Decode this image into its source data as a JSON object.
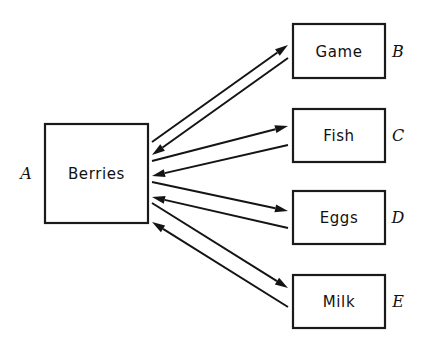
{
  "diagram": {
    "type": "flow-exchange-diagram",
    "background_color": "#ffffff",
    "line_color": "#141414",
    "text_color": "#111111",
    "hub": {
      "key": "A",
      "label": "Berries",
      "box": {
        "x": 45,
        "y": 124,
        "width": 103,
        "height": 99
      },
      "key_position": {
        "x": 26,
        "y": 174
      }
    },
    "nodes": [
      {
        "key": "B",
        "label": "Game",
        "box": {
          "x": 293,
          "y": 24,
          "width": 92,
          "height": 54
        },
        "key_position": {
          "x": 398,
          "y": 52
        }
      },
      {
        "key": "C",
        "label": "Fish",
        "box": {
          "x": 293,
          "y": 109,
          "width": 92,
          "height": 53
        },
        "key_position": {
          "x": 398,
          "y": 136
        }
      },
      {
        "key": "D",
        "label": "Eggs",
        "box": {
          "x": 293,
          "y": 191,
          "width": 92,
          "height": 53
        },
        "key_position": {
          "x": 398,
          "y": 218
        }
      },
      {
        "key": "E",
        "label": "Milk",
        "box": {
          "x": 293,
          "y": 275,
          "width": 92,
          "height": 53
        },
        "key_position": {
          "x": 398,
          "y": 302
        }
      }
    ],
    "connections": [
      {
        "name": "berries-to-game",
        "from": "A",
        "to": "B",
        "direction": "outbound",
        "start": {
          "x": 152,
          "y": 142
        },
        "end": {
          "x": 288,
          "y": 45
        }
      },
      {
        "name": "game-to-berries",
        "from": "B",
        "to": "A",
        "direction": "inbound",
        "start": {
          "x": 288,
          "y": 58
        },
        "end": {
          "x": 152,
          "y": 155
        }
      },
      {
        "name": "berries-to-fish",
        "from": "A",
        "to": "C",
        "direction": "outbound",
        "start": {
          "x": 152,
          "y": 161
        },
        "end": {
          "x": 288,
          "y": 126
        }
      },
      {
        "name": "fish-to-berries",
        "from": "C",
        "to": "A",
        "direction": "inbound",
        "start": {
          "x": 288,
          "y": 145
        },
        "end": {
          "x": 152,
          "y": 176
        }
      },
      {
        "name": "berries-to-eggs",
        "from": "A",
        "to": "D",
        "direction": "outbound",
        "start": {
          "x": 152,
          "y": 182
        },
        "end": {
          "x": 288,
          "y": 211
        }
      },
      {
        "name": "eggs-to-berries",
        "from": "D",
        "to": "A",
        "direction": "inbound",
        "start": {
          "x": 288,
          "y": 228
        },
        "end": {
          "x": 152,
          "y": 197
        }
      },
      {
        "name": "berries-to-milk",
        "from": "A",
        "to": "E",
        "direction": "outbound",
        "start": {
          "x": 152,
          "y": 203
        },
        "end": {
          "x": 288,
          "y": 288
        }
      },
      {
        "name": "milk-to-berries",
        "from": "E",
        "to": "A",
        "direction": "inbound",
        "start": {
          "x": 288,
          "y": 307
        },
        "end": {
          "x": 152,
          "y": 222
        }
      }
    ]
  }
}
